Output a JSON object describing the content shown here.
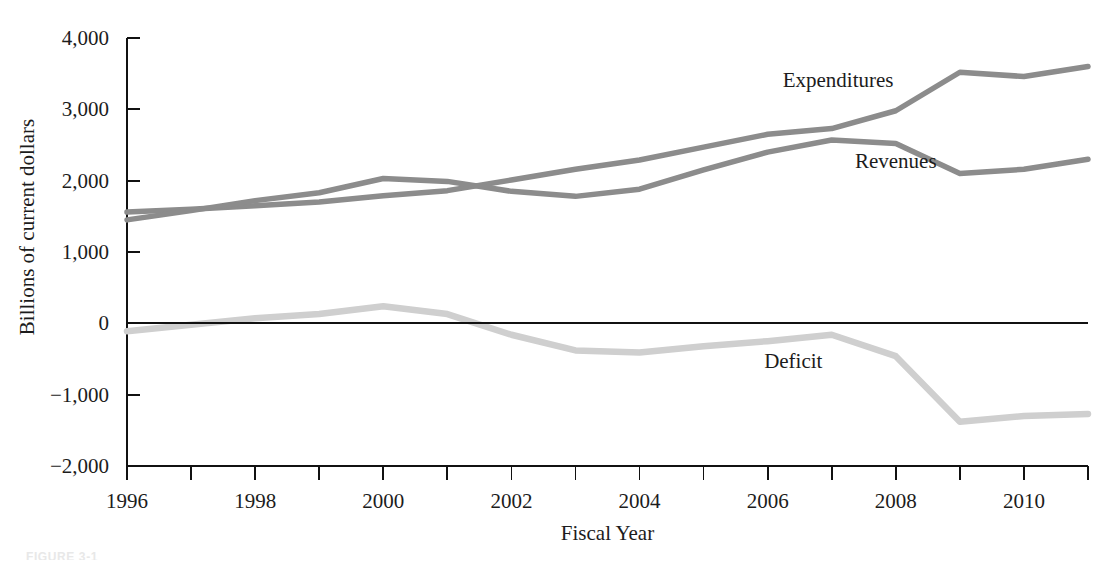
{
  "figure": {
    "caption_partial": "FIGURE 3-1",
    "background_color": "#ffffff"
  },
  "chart_data": {
    "type": "line",
    "title": "",
    "xlabel": "Fiscal Year",
    "ylabel": "Billions of current dollars",
    "xlim": [
      1996,
      2011
    ],
    "ylim": [
      -2000,
      4000
    ],
    "grid": false,
    "legend_position": "inline-labels",
    "x": [
      1996,
      1997,
      1998,
      1999,
      2000,
      2001,
      2002,
      2003,
      2004,
      2005,
      2006,
      2007,
      2008,
      2009,
      2010,
      2011
    ],
    "x_tick_labels": [
      "1996",
      "",
      "1998",
      "",
      "2000",
      "",
      "2002",
      "",
      "2004",
      "",
      "2006",
      "",
      "2008",
      "",
      "2010",
      ""
    ],
    "x_major_labels": [
      "1996",
      "1998",
      "2000",
      "2002",
      "2004",
      "2006",
      "2008",
      "2010"
    ],
    "y_tick_values": [
      4000,
      3000,
      2000,
      1000,
      0,
      -1000,
      -2000
    ],
    "y_tick_labels": [
      "4,000",
      "3,000",
      "2,000",
      "1,000",
      "0",
      "−1,000",
      "−2,000"
    ],
    "series": [
      {
        "name": "Expenditures",
        "color": "#8c8c8c",
        "label_x": 2007.1,
        "label_y": 3320,
        "values": [
          1560,
          1600,
          1650,
          1700,
          1790,
          1860,
          2010,
          2160,
          2290,
          2470,
          2650,
          2730,
          2980,
          3520,
          3460,
          3600
        ]
      },
      {
        "name": "Revenues",
        "color": "#8c8c8c",
        "label_x": 2008.0,
        "label_y": 2180,
        "values": [
          1450,
          1580,
          1720,
          1830,
          2030,
          1990,
          1850,
          1780,
          1880,
          2150,
          2400,
          2570,
          2520,
          2100,
          2160,
          2300
        ]
      },
      {
        "name": "Deficit",
        "color": "#cfcfcf",
        "label_x": 2006.4,
        "label_y": -620,
        "values": [
          -110,
          -20,
          70,
          130,
          240,
          130,
          -160,
          -380,
          -410,
          -320,
          -250,
          -160,
          -460,
          -1380,
          -1300,
          -1270
        ]
      }
    ]
  }
}
